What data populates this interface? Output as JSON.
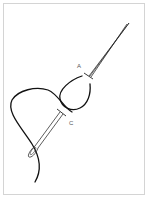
{
  "figure": {
    "title": "",
    "labels": [
      {
        "id": "A",
        "text": "A",
        "x": 77,
        "y": 63
      },
      {
        "id": "C",
        "text": "C",
        "x": 69,
        "y": 120
      }
    ],
    "colors": {
      "thread": "#111111",
      "needle_outline": "#333333",
      "border": "#d4d4d4",
      "label": "#555555",
      "background": "#ffffff"
    }
  }
}
